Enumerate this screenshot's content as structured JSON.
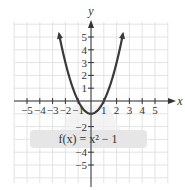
{
  "chart_data": {
    "type": "line",
    "title": "",
    "function_label": "f(x) = x² − 1",
    "xlabel": "x",
    "ylabel": "y",
    "xlim": [
      -5.5,
      5.5
    ],
    "ylim": [
      -6.2,
      6.1
    ],
    "x_ticks": [
      -5,
      -4,
      -3,
      -2,
      -1,
      1,
      2,
      3,
      4,
      5
    ],
    "x_tick_labels": [
      "−5",
      "−4",
      "−3",
      "−2",
      "−1",
      "1",
      "2",
      "3",
      "4",
      "5"
    ],
    "y_ticks": [
      5,
      4,
      3,
      2,
      1,
      -2,
      -4,
      -5
    ],
    "y_tick_labels": [
      "5",
      "4",
      "3",
      "2",
      "1",
      "−2",
      "−4",
      "−5"
    ],
    "grid": true,
    "series": [
      {
        "name": "f(x) = x^2 - 1",
        "x": [
          -2.5,
          -2,
          -1.5,
          -1,
          -0.5,
          0,
          0.5,
          1,
          1.5,
          2,
          2.5
        ],
        "y": [
          5.25,
          3,
          1.25,
          0,
          -0.75,
          -1,
          -0.75,
          0,
          1.25,
          3,
          5.25
        ]
      }
    ],
    "curve_color": "#3a3a3a",
    "label_box_color": "#e6e6e6"
  }
}
